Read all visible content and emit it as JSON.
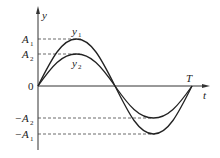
{
  "diagram": {
    "axes": {
      "y_label": "y",
      "x_label": "t",
      "origin_label": "0",
      "period_label": "T"
    },
    "levels": [
      {
        "name": "A",
        "sub": "1",
        "sign": ""
      },
      {
        "name": "A",
        "sub": "2",
        "sign": ""
      },
      {
        "name": "A",
        "sub": "2",
        "sign": "−"
      },
      {
        "name": "A",
        "sub": "1",
        "sign": "−"
      }
    ],
    "curves": [
      {
        "name": "y",
        "sub": "1",
        "amplitude": "A1"
      },
      {
        "name": "y",
        "sub": "2",
        "amplitude": "A2"
      }
    ],
    "colors": {
      "stroke": "#222222",
      "dash": "#444444"
    }
  }
}
